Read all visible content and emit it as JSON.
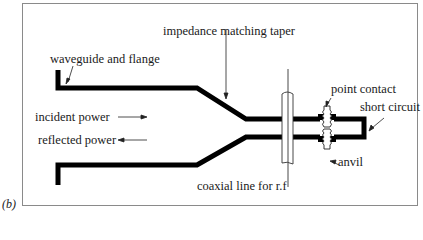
{
  "figure": {
    "panel_label": "(b)",
    "labels": {
      "waveguide": "waveguide and flange",
      "taper": "impedance matching taper",
      "incident": "incident power",
      "reflected": "reflected power",
      "point_contact": "point contact",
      "short_circuit": "short circuit",
      "anvil": "anvil",
      "coax": "coaxial line for r.f"
    },
    "colors": {
      "line": "#000000",
      "frame": "#8a8a8a",
      "text": "#1a1a1a"
    }
  }
}
